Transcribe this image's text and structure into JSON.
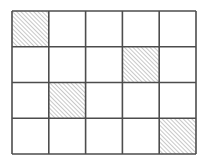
{
  "grid": {
    "rows": 4,
    "cols": 5,
    "line_color": "#4d4d4d",
    "hatch_color": "#9a9a9a",
    "shaded_cells": [
      {
        "row": 0,
        "col": 0
      },
      {
        "row": 1,
        "col": 3
      },
      {
        "row": 2,
        "col": 1
      },
      {
        "row": 3,
        "col": 4
      }
    ]
  }
}
